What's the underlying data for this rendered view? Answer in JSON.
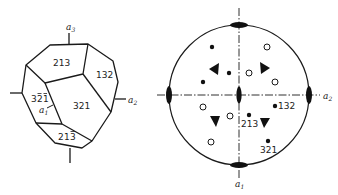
{
  "figure": {
    "left_panel": {
      "title": "crystal-polyhedron",
      "axis_labels": {
        "a1": "a",
        "a1_sub": "1",
        "a2": "a",
        "a2_sub": "2",
        "a3": "a",
        "a3_sub": "3"
      },
      "faces": [
        {
          "id": "213",
          "label": "213"
        },
        {
          "id": "132",
          "label": "132"
        },
        {
          "id": "321",
          "label": "321"
        },
        {
          "id": "3-2-1",
          "label_digits": [
            "3",
            "2",
            "1"
          ],
          "bars": [
            false,
            true,
            true
          ]
        },
        {
          "id": "21-3",
          "label_digits": [
            "2",
            "1",
            "3"
          ],
          "bars": [
            false,
            false,
            true
          ]
        }
      ]
    },
    "right_panel": {
      "title": "stereographic-projection",
      "axis_labels": {
        "a1": "a",
        "a1_sub": "1",
        "a2": "a",
        "a2_sub": "2"
      },
      "pole_labels": {
        "p132": "132",
        "p213": "213",
        "p321": "321"
      },
      "filled_poles": 6,
      "open_poles": 6,
      "threefold_axes": 4,
      "twofold_axes": 5
    }
  }
}
